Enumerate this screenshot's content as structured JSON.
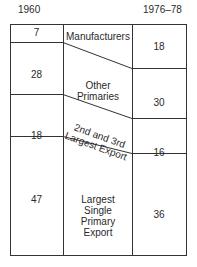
{
  "header": {
    "left_year": "1960",
    "right_year": "1976–78"
  },
  "categories": {
    "manufacturers": "Manufacturers",
    "other_primaries": [
      "Other",
      "Primaries"
    ],
    "second_third": [
      "2nd and 3rd",
      "Largest Export"
    ],
    "largest": [
      "Largest",
      "Single",
      "Primary",
      "Export"
    ]
  },
  "values_1960": {
    "manufacturers": "7",
    "other_primaries": "28",
    "second_third": "18",
    "largest": "47"
  },
  "values_1976_78": {
    "manufacturers": "18",
    "other_primaries": "30",
    "second_third": "16",
    "largest": "36"
  },
  "colors": {
    "line": "#333333",
    "text": "#2a2a2a",
    "background": "#ffffff"
  }
}
